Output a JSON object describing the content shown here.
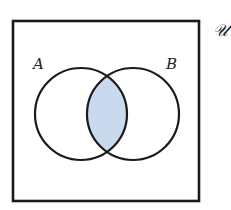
{
  "diagram": {
    "type": "venn",
    "universe_label": "𝒰",
    "sets": [
      {
        "id": "A",
        "label": "A"
      },
      {
        "id": "B",
        "label": "B"
      }
    ],
    "shaded_region": "A ∩ B",
    "colors": {
      "stroke": "#1a1a1a",
      "shade": "#c9d9ee",
      "background": "#ffffff"
    }
  }
}
